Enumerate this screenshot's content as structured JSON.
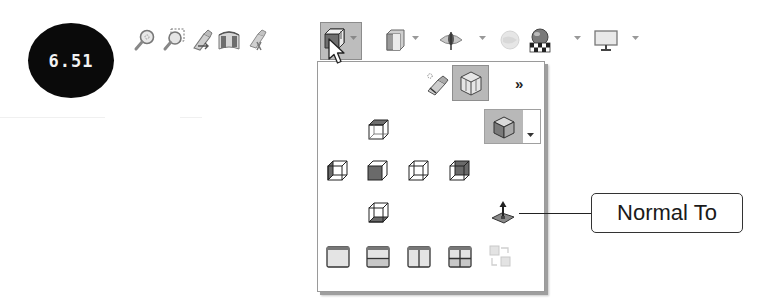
{
  "figure": {
    "label": "6.51"
  },
  "toolbar": {
    "items": [
      {
        "name": "zoom-to-fit",
        "icon": "zoom-to-fit-icon"
      },
      {
        "name": "zoom-to-area",
        "icon": "zoom-to-area-icon"
      },
      {
        "name": "previous-view",
        "icon": "previous-view-icon"
      },
      {
        "name": "section-view",
        "icon": "section-view-icon"
      },
      {
        "name": "dynamic-annotation-views",
        "icon": "dynamic-annotation-icon"
      },
      {
        "name": "view-orientation",
        "icon": "view-orientation-icon",
        "active": true,
        "has_dropdown": true
      },
      {
        "name": "display-style",
        "icon": "display-style-icon",
        "has_dropdown": true
      },
      {
        "name": "hide-show-items",
        "icon": "hide-show-icon",
        "has_dropdown": true
      },
      {
        "name": "edit-appearance",
        "icon": "edit-appearance-icon"
      },
      {
        "name": "apply-scene",
        "icon": "apply-scene-icon",
        "has_dropdown": true
      },
      {
        "name": "view-settings",
        "icon": "view-settings-icon",
        "has_dropdown": true
      }
    ]
  },
  "flyout": {
    "top_row": [
      {
        "name": "previous-view",
        "icon": "previous-view-icon"
      },
      {
        "name": "view-selector",
        "icon": "view-selector-icon",
        "active": true
      },
      {
        "name": "expand",
        "label": "»"
      }
    ],
    "views": [
      {
        "name": "top",
        "icon": "cube-top-icon"
      },
      {
        "name": "isometric",
        "icon": "isometric-icon",
        "split_button": true
      },
      {
        "name": "left",
        "icon": "cube-left-icon"
      },
      {
        "name": "front",
        "icon": "cube-front-icon"
      },
      {
        "name": "right",
        "icon": "cube-right-icon"
      },
      {
        "name": "back",
        "icon": "cube-back-icon"
      },
      {
        "name": "bottom",
        "icon": "cube-bottom-icon"
      },
      {
        "name": "normal-to",
        "icon": "normal-to-icon"
      }
    ],
    "viewports": [
      {
        "name": "single-view",
        "icon": "single-view-icon"
      },
      {
        "name": "two-view-horizontal",
        "icon": "two-view-horizontal-icon"
      },
      {
        "name": "two-view-vertical",
        "icon": "two-view-vertical-icon"
      },
      {
        "name": "four-view",
        "icon": "four-view-icon"
      },
      {
        "name": "link-views",
        "icon": "link-views-icon",
        "disabled": true
      }
    ]
  },
  "callout": {
    "label": "Normal To"
  },
  "colors": {
    "badge_bg": "#0a0a0a",
    "active_bg": "#b8b8b8",
    "panel_border": "#9a9a9a",
    "callout_border": "#333333"
  }
}
